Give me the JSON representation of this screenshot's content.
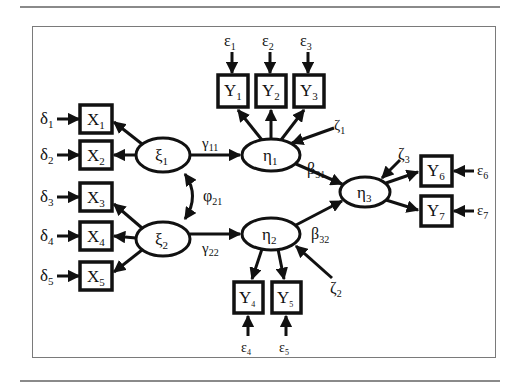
{
  "figure": {
    "type": "structural-equation-model path diagram",
    "exogenous_latents": [
      {
        "id": "xi1",
        "label": "ξ",
        "sub": "1"
      },
      {
        "id": "xi2",
        "label": "ξ",
        "sub": "2"
      }
    ],
    "endogenous_latents": [
      {
        "id": "eta1",
        "label": "η",
        "sub": "1"
      },
      {
        "id": "eta2",
        "label": "η",
        "sub": "2"
      },
      {
        "id": "eta3",
        "label": "η",
        "sub": "3"
      }
    ],
    "x_indicators": [
      {
        "label": "X",
        "sub": "1",
        "error": "δ",
        "esub": "1"
      },
      {
        "label": "X",
        "sub": "2",
        "error": "δ",
        "esub": "2"
      },
      {
        "label": "X",
        "sub": "3",
        "error": "δ",
        "esub": "3"
      },
      {
        "label": "X",
        "sub": "4",
        "error": "δ",
        "esub": "4"
      },
      {
        "label": "X",
        "sub": "5",
        "error": "δ",
        "esub": "5"
      }
    ],
    "y_indicators": [
      {
        "label": "Y",
        "sub": "1",
        "error": "ε",
        "esub": "1"
      },
      {
        "label": "Y",
        "sub": "2",
        "error": "ε",
        "esub": "2"
      },
      {
        "label": "Y",
        "sub": "3",
        "error": "ε",
        "esub": "3"
      },
      {
        "label": "Y",
        "sub": "4",
        "error": "ε",
        "esub": "4"
      },
      {
        "label": "Y",
        "sub": "5",
        "error": "ε",
        "esub": "5"
      },
      {
        "label": "Y",
        "sub": "6",
        "error": "ε",
        "esub": "6"
      },
      {
        "label": "Y",
        "sub": "7",
        "error": "ε",
        "esub": "7"
      }
    ],
    "paths": {
      "gamma11": {
        "label": "γ",
        "sub": "11"
      },
      "gamma22": {
        "label": "γ",
        "sub": "22"
      },
      "beta31": {
        "label": "β",
        "sub": "31"
      },
      "beta32": {
        "label": "β",
        "sub": "32"
      },
      "phi21": {
        "label": "φ",
        "sub": "21"
      }
    },
    "disturbances": [
      {
        "label": "ζ",
        "sub": "1"
      },
      {
        "label": "ζ",
        "sub": "2"
      },
      {
        "label": "ζ",
        "sub": "3"
      }
    ]
  }
}
